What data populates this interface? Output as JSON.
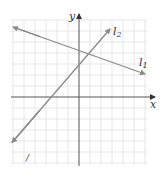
{
  "figure": {
    "axes": {
      "x_label": "x",
      "y_label": "y"
    },
    "lines": [
      {
        "name": "l1",
        "label_main": "l",
        "label_sub": "1",
        "slope_sign": "negative"
      },
      {
        "name": "l2",
        "label_main": "l",
        "label_sub": "2",
        "slope_sign": "positive"
      }
    ],
    "colors": {
      "grid": "#e6e6e6",
      "axis": "#555555",
      "line": "#8a8a8a",
      "text": "#333333"
    },
    "stray_mark": "/"
  }
}
